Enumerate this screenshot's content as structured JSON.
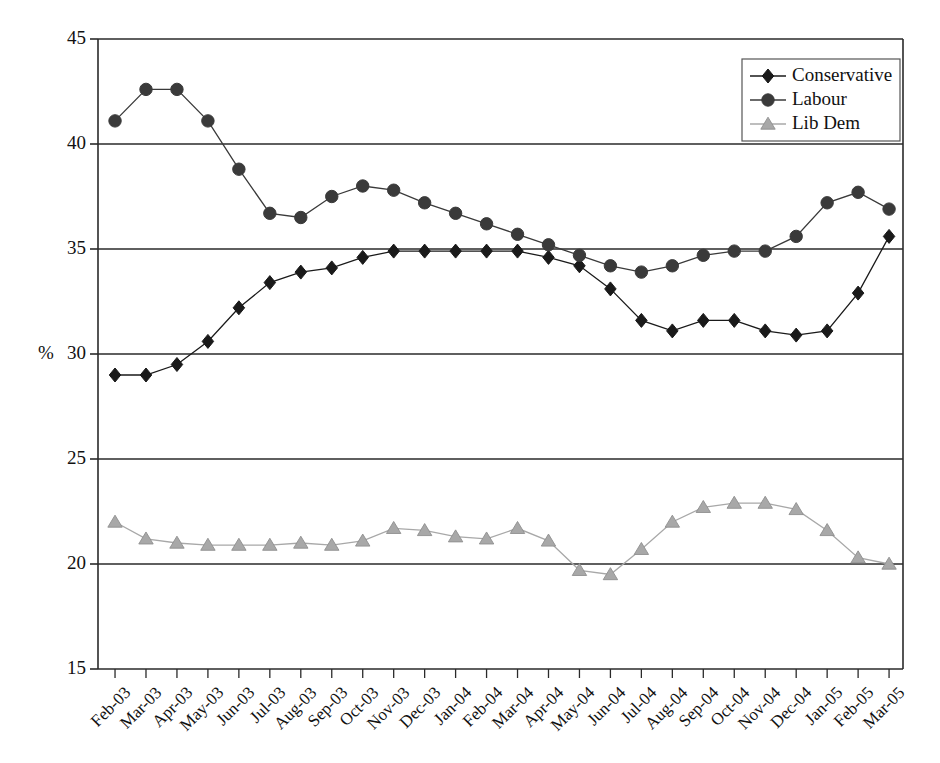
{
  "chart_data": {
    "type": "line",
    "title": "",
    "subtitle": "",
    "xlabel": "",
    "ylabel": "%",
    "ylim": [
      15,
      45
    ],
    "ytick_step": 5,
    "yticks": [
      15,
      20,
      25,
      30,
      35,
      40,
      45
    ],
    "grid": true,
    "grid_axis": "y",
    "legend_position": "top-right",
    "categories": [
      "Feb-03",
      "Mar-03",
      "Apr-03",
      "May-03",
      "Jun-03",
      "Jul-03",
      "Aug-03",
      "Sep-03",
      "Oct-03",
      "Nov-03",
      "Dec-03",
      "Jan-04",
      "Feb-04",
      "Mar-04",
      "Apr-04",
      "May-04",
      "Jun-04",
      "Jul-04",
      "Aug-04",
      "Sep-04",
      "Oct-04",
      "Nov-04",
      "Dec-04",
      "Jan-05",
      "Feb-05",
      "Mar-05"
    ],
    "series": [
      {
        "name": "Conservative",
        "color": "#1a1a1a",
        "marker": "diamond",
        "values": [
          29.0,
          29.0,
          29.5,
          30.6,
          32.2,
          33.4,
          33.9,
          34.1,
          34.6,
          34.9,
          34.9,
          34.9,
          34.9,
          34.9,
          34.6,
          34.2,
          33.1,
          31.6,
          31.1,
          31.6,
          31.6,
          31.1,
          30.9,
          31.1,
          32.9,
          35.6
        ]
      },
      {
        "name": "Labour",
        "color": "#3a3a3a",
        "marker": "circle",
        "values": [
          41.1,
          42.6,
          42.6,
          41.1,
          38.8,
          36.7,
          36.5,
          37.5,
          38.0,
          37.8,
          37.2,
          36.7,
          36.2,
          35.7,
          35.2,
          34.7,
          34.2,
          33.9,
          34.2,
          34.7,
          34.9,
          34.9,
          35.6,
          37.2,
          37.7,
          36.9
        ]
      },
      {
        "name": "Lib Dem",
        "color": "#a8a8a8",
        "marker": "triangle",
        "values": [
          22.0,
          21.2,
          21.0,
          20.9,
          20.9,
          20.9,
          21.0,
          20.9,
          21.1,
          21.7,
          21.6,
          21.3,
          21.2,
          21.7,
          21.1,
          19.7,
          19.5,
          20.7,
          22.0,
          22.7,
          22.9,
          22.9,
          22.6,
          21.6,
          20.3,
          20.0
        ]
      }
    ]
  },
  "legend": {
    "items": [
      {
        "label": "Conservative"
      },
      {
        "label": "Labour"
      },
      {
        "label": "Lib Dem"
      }
    ]
  }
}
